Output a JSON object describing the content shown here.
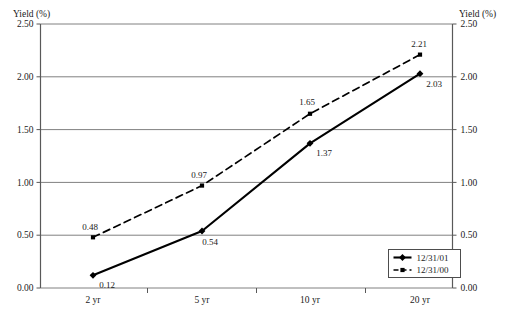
{
  "chart_data": {
    "type": "line",
    "title": "",
    "categories": [
      "2 yr",
      "5 yr",
      "10 yr",
      "20 yr"
    ],
    "series": [
      {
        "name": "12/31/01",
        "values": [
          0.12,
          0.54,
          1.37,
          2.03
        ],
        "marker": "diamond",
        "line_style": "solid",
        "color": "#000000"
      },
      {
        "name": "12/31/00",
        "values": [
          0.48,
          0.97,
          1.65,
          2.21
        ],
        "marker": "square",
        "line_style": "dashed",
        "color": "#000000"
      }
    ],
    "ylabel_left": "Yield (%)",
    "ylabel_right": "Yield (%)",
    "xlabel": "",
    "ylim": [
      0.0,
      2.5
    ],
    "yticks": [
      "0.00",
      "0.50",
      "1.00",
      "1.50",
      "2.00",
      "2.50"
    ],
    "ytick_values": [
      0.0,
      0.5,
      1.0,
      1.5,
      2.0,
      2.5
    ],
    "grid": true,
    "legend_position": "bottom-right",
    "point_labels": {
      "series_0": [
        "0.12",
        "0.54",
        "1.37",
        "2.03"
      ],
      "series_1": [
        "0.48",
        "0.97",
        "1.65",
        "2.21"
      ]
    }
  },
  "legend": {
    "entries": [
      {
        "label": "12/31/01"
      },
      {
        "label": "12/31/00"
      }
    ]
  },
  "axes": {
    "left_title": "Yield (%)",
    "right_title": "Yield (%)"
  }
}
